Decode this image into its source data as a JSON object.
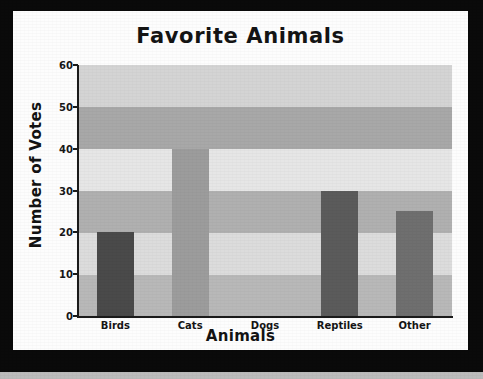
{
  "chart_data": {
    "type": "bar",
    "title": "Favorite Animals",
    "xlabel": "Animals",
    "ylabel": "Number of Votes",
    "categories": [
      "Birds",
      "Cats",
      "Dogs",
      "Reptiles",
      "Other"
    ],
    "values": [
      20,
      40,
      0,
      30,
      25
    ],
    "ylim": [
      0,
      60
    ],
    "yticks": [
      0,
      10,
      20,
      30,
      40,
      50,
      60
    ],
    "ytick_labels": [
      "0",
      "10",
      "20",
      "30",
      "40",
      "50",
      "60"
    ],
    "grid": false,
    "legend": "none",
    "bar_colors": [
      "#4a4a4a",
      "#9c9c9c",
      "#d9d9d9",
      "#5b5b5b",
      "#6f6f6f"
    ],
    "background_bands": [
      {
        "from": 0,
        "to": 10,
        "color": "#b8b8b8"
      },
      {
        "from": 10,
        "to": 20,
        "color": "#dcdcdc"
      },
      {
        "from": 20,
        "to": 30,
        "color": "#b0b0b0"
      },
      {
        "from": 30,
        "to": 40,
        "color": "#e6e6e6"
      },
      {
        "from": 40,
        "to": 50,
        "color": "#a8a8a8"
      },
      {
        "from": 50,
        "to": 60,
        "color": "#d4d4d4"
      }
    ],
    "plot_background": "#d0d0d0",
    "frame_color": "#0a0a0a",
    "paper_color": "#fdfdfd",
    "axis_color": "#1b1b1b"
  }
}
